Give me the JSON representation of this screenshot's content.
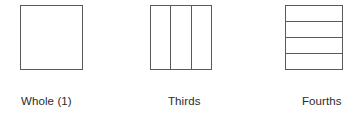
{
  "figure": {
    "background_color": "#ffffff",
    "line_color": "#595959",
    "text_color": "#2b2b2b",
    "shapes": [
      {
        "label": "Whole (1)",
        "divisions": 1,
        "orientation": "none",
        "shape": "square"
      },
      {
        "label": "Thirds",
        "divisions": 3,
        "orientation": "vertical",
        "shape": "square"
      },
      {
        "label": "Fourths",
        "divisions": 4,
        "orientation": "horizontal",
        "shape": "square"
      }
    ]
  }
}
